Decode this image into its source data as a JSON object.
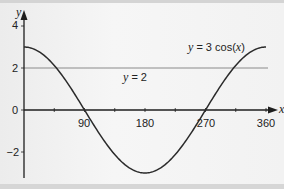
{
  "chart_data": {
    "type": "line",
    "title": "",
    "xlabel": "x",
    "ylabel": "y",
    "xlim": [
      0,
      360
    ],
    "ylim": [
      -3,
      4
    ],
    "x_ticks": [
      90,
      180,
      270,
      360
    ],
    "x_minor_ticks": [
      45,
      135,
      225,
      315
    ],
    "y_ticks": [
      4,
      2,
      0,
      -2
    ],
    "grid": false,
    "series": [
      {
        "name": "y = 3 cos(x)",
        "x": [
          0,
          30,
          60,
          90,
          120,
          150,
          180,
          210,
          240,
          270,
          300,
          330,
          360
        ],
        "values": [
          3,
          2.6,
          1.5,
          0,
          -1.5,
          -2.6,
          -3,
          -2.6,
          -1.5,
          0,
          1.5,
          2.6,
          3
        ]
      },
      {
        "name": "y = 2",
        "x": [
          0,
          360
        ],
        "values": [
          2,
          2
        ]
      }
    ],
    "annotations": [
      {
        "text_parts": [
          "y",
          " = 3 cos(",
          "x",
          ")"
        ],
        "label": "y = 3 cos(x)",
        "near": [
          300,
          2.6
        ]
      },
      {
        "text_parts": [
          "y",
          " = 2"
        ],
        "label": "y = 2",
        "near": [
          170,
          1.6
        ]
      }
    ]
  },
  "labels": {
    "x_axis": "x",
    "y_axis": "y",
    "x_ticks": [
      "90",
      "180",
      "270",
      "360"
    ],
    "y_ticks": [
      "4",
      "2",
      "0",
      "−2"
    ],
    "curve_label_prefix": "y",
    "curve_label_mid": " = 3 cos(",
    "curve_label_var": "x",
    "curve_label_end": ")",
    "line_label_prefix": "y",
    "line_label_rest": " = 2"
  },
  "colors": {
    "curve": "#2a2a2a",
    "hline": "#8a8a8a",
    "axis": "#1e1e1e"
  }
}
